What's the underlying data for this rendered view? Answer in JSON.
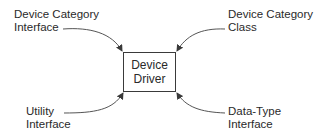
{
  "diagram": {
    "center": {
      "line1": "Device",
      "line2": "Driver"
    },
    "inputs": [
      {
        "position": "top-left",
        "line1": "Device Category",
        "line2": "Interface"
      },
      {
        "position": "top-right",
        "line1": "Device Category",
        "line2": "Class"
      },
      {
        "position": "bottom-left",
        "line1": "Utility",
        "line2": "Interface"
      },
      {
        "position": "bottom-right",
        "line1": "Data-Type",
        "line2": "Interface"
      }
    ],
    "colors": {
      "stroke": "#3a3a3a",
      "text": "#2a2a2a",
      "background": "#ffffff"
    }
  }
}
